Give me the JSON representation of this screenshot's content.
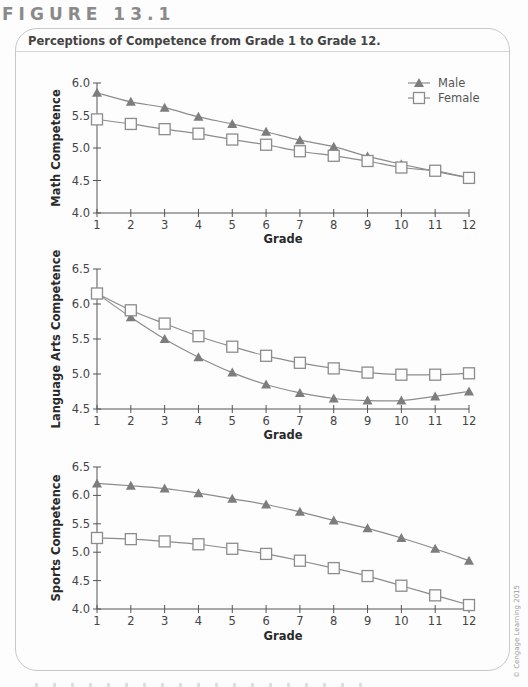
{
  "figure_label": "FIGURE 13.1",
  "frame_title": "Perceptions of Competence from Grade 1 to Grade 12.",
  "copyright": "© Cengage Learning 2015",
  "colors": {
    "line": "#8c8c8c",
    "male_marker": "#7d7d7d",
    "female_marker": "#8c8c8c",
    "axis": "#555555",
    "text": "#2a2a2a"
  },
  "legend": {
    "male": "Male",
    "female": "Female"
  },
  "chart_data": [
    {
      "type": "line",
      "title": "",
      "xlabel": "Grade",
      "ylabel": "Math Competence",
      "x": [
        1,
        2,
        3,
        4,
        5,
        6,
        7,
        8,
        9,
        10,
        11,
        12
      ],
      "ylim": [
        4.0,
        6.0
      ],
      "yticks": [
        "4.0",
        "4.5",
        "5.0",
        "5.5",
        "6.0"
      ],
      "legend_position": "upper right",
      "grid": false,
      "series": [
        {
          "name": "Male",
          "marker": "filled-triangle",
          "values": [
            5.85,
            5.71,
            5.62,
            5.48,
            5.37,
            5.25,
            5.12,
            5.02,
            4.87,
            4.75,
            4.64,
            4.54
          ]
        },
        {
          "name": "Female",
          "marker": "open-square",
          "values": [
            5.44,
            5.37,
            5.29,
            5.22,
            5.13,
            5.05,
            4.95,
            4.88,
            4.8,
            4.7,
            4.65,
            4.54
          ]
        }
      ]
    },
    {
      "type": "line",
      "title": "",
      "xlabel": "Grade",
      "ylabel": "Language Arts Competence",
      "x": [
        1,
        2,
        3,
        4,
        5,
        6,
        7,
        8,
        9,
        10,
        11,
        12
      ],
      "ylim": [
        4.5,
        6.5
      ],
      "yticks": [
        "4.5",
        "5.0",
        "5.5",
        "6.0",
        "6.5"
      ],
      "grid": false,
      "series": [
        {
          "name": "Male",
          "marker": "filled-triangle",
          "values": [
            6.15,
            5.81,
            5.5,
            5.24,
            5.02,
            4.85,
            4.73,
            4.65,
            4.62,
            4.62,
            4.68,
            4.75
          ]
        },
        {
          "name": "Female",
          "marker": "open-square",
          "values": [
            6.15,
            5.91,
            5.72,
            5.54,
            5.39,
            5.26,
            5.16,
            5.08,
            5.02,
            4.99,
            4.99,
            5.01
          ]
        }
      ]
    },
    {
      "type": "line",
      "title": "",
      "xlabel": "Grade",
      "ylabel": "Sports Competence",
      "x": [
        1,
        2,
        3,
        4,
        5,
        6,
        7,
        8,
        9,
        10,
        11,
        12
      ],
      "ylim": [
        4.0,
        6.5
      ],
      "yticks": [
        "4.0",
        "4.5",
        "5.0",
        "5.5",
        "6.0",
        "6.5"
      ],
      "grid": false,
      "series": [
        {
          "name": "Male",
          "marker": "filled-triangle",
          "values": [
            6.21,
            6.17,
            6.12,
            6.04,
            5.94,
            5.84,
            5.71,
            5.56,
            5.42,
            5.25,
            5.06,
            4.85
          ]
        },
        {
          "name": "Female",
          "marker": "open-square",
          "values": [
            5.25,
            5.23,
            5.19,
            5.14,
            5.06,
            4.97,
            4.85,
            4.72,
            4.58,
            4.41,
            4.24,
            4.07
          ]
        }
      ]
    }
  ]
}
